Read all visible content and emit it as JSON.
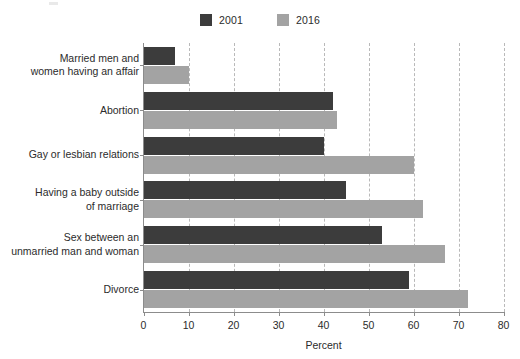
{
  "chart_data": {
    "type": "bar",
    "orientation": "horizontal",
    "title": "",
    "subtitle": "",
    "xlabel": "Percent",
    "ylabel": "",
    "xlim": [
      0,
      80
    ],
    "xticks": [
      0,
      10,
      20,
      30,
      40,
      50,
      60,
      70,
      80
    ],
    "xtick_labels": [
      "0",
      "10",
      "20",
      "30",
      "40",
      "50",
      "60",
      "70",
      "80"
    ],
    "grid": "vertical-dashed",
    "legend_position": "top-center",
    "categories": [
      "Married men and\nwomen having an affair",
      "Abortion",
      "Gay or lesbian relations",
      "Having a baby outside\nof marriage",
      "Sex between an\nunmarried man and woman",
      "Divorce"
    ],
    "category_lines": [
      [
        "Married men and",
        "women having an affair"
      ],
      [
        "Abortion"
      ],
      [
        "Gay or lesbian relations"
      ],
      [
        "Having a baby outside",
        "of marriage"
      ],
      [
        "Sex between an",
        "unmarried man and woman"
      ],
      [
        "Divorce"
      ]
    ],
    "series": [
      {
        "name": "2001",
        "color": "#3c3c3c",
        "values": [
          7,
          42,
          40,
          45,
          53,
          59
        ]
      },
      {
        "name": "2016",
        "color": "#a3a3a3",
        "values": [
          10,
          43,
          60,
          62,
          67,
          72
        ]
      }
    ]
  },
  "legend": {
    "entries": [
      {
        "label": "2001",
        "color": "#3c3c3c"
      },
      {
        "label": "2016",
        "color": "#a3a3a3"
      }
    ]
  },
  "axis": {
    "x_title": "Percent"
  },
  "colors": {
    "series_2001": "#3c3c3c",
    "series_2016": "#a3a3a3",
    "axis_line": "#8c8c8c",
    "gridline": "#b9b9b9",
    "text": "#2b2b2b",
    "background": "#ffffff"
  }
}
